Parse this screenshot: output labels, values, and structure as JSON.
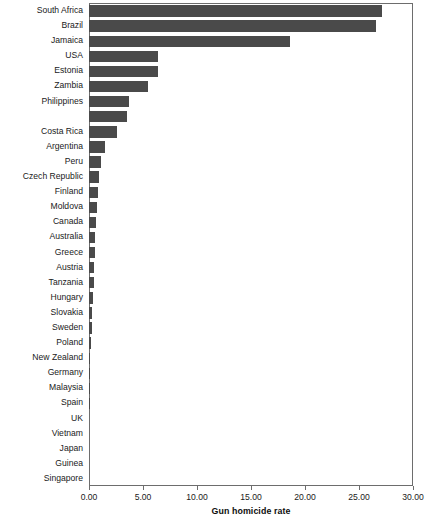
{
  "chart_data": {
    "type": "bar",
    "orientation": "horizontal",
    "title": "",
    "xlabel": "Gun homicide rate",
    "ylabel": "",
    "xlim": [
      0.0,
      30.0
    ],
    "xticks": [
      "0.00",
      "5.00",
      "10.00",
      "15.00",
      "20.00",
      "25.00",
      "30.00"
    ],
    "xtick_values": [
      0,
      5,
      10,
      15,
      20,
      25,
      30
    ],
    "grid": false,
    "legend": false,
    "bar_color": "#4a4a4a",
    "frame_color": "#6d6d6d",
    "categories": [
      "South Africa",
      "Brazil",
      "Jamaica",
      "USA",
      "Estonia",
      "Zambia",
      "Philippines",
      "",
      "Costa Rica",
      "Argentina",
      "Peru",
      "Czech Republic",
      "Finland",
      "Moldova",
      "Canada",
      "Australia",
      "Greece",
      "Austria",
      "Tanzania",
      "Hungary",
      "Slovakia",
      "Sweden",
      "Poland",
      "New Zealand",
      "Germany",
      "Malaysia",
      "Spain",
      "UK",
      "Vietnam",
      "Japan",
      "Guinea",
      "Singapore"
    ],
    "values": [
      27.1,
      26.6,
      18.6,
      6.4,
      6.4,
      5.5,
      3.7,
      3.5,
      2.6,
      1.5,
      1.1,
      0.95,
      0.85,
      0.7,
      0.65,
      0.6,
      0.55,
      0.5,
      0.45,
      0.35,
      0.3,
      0.25,
      0.15,
      0.13,
      0.12,
      0.1,
      0.09,
      0.07,
      0.05,
      0.04,
      0.03,
      0.02
    ]
  }
}
